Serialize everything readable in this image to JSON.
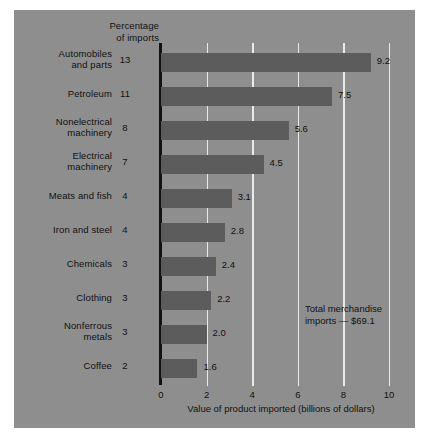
{
  "chart_data": {
    "type": "bar",
    "orientation": "horizontal",
    "title": "",
    "header_label": "Percentage\nof imports",
    "header_label_line1": "Percentage",
    "header_label_line2": "of imports",
    "categories": [
      "Automobiles and parts",
      "Petroleum",
      "Nonelectrical machinery",
      "Electrical machinery",
      "Meats and fish",
      "Iron and steel",
      "Chemicals",
      "Clothing",
      "Nonferrous metals",
      "Coffee"
    ],
    "values": [
      9.2,
      7.5,
      5.6,
      4.5,
      3.1,
      2.8,
      2.4,
      2.2,
      2.0,
      1.6
    ],
    "percentages": [
      13,
      11,
      8,
      7,
      4,
      4,
      3,
      3,
      3,
      2
    ],
    "xlabel": "Value of product imported (billions of dollars)",
    "ylabel": "",
    "xlim": [
      0,
      10
    ],
    "xticks": [
      0,
      2,
      4,
      6,
      8,
      10
    ],
    "xtick_labels": [
      "0",
      "2",
      "4",
      "6",
      "8",
      "10"
    ],
    "grid": "vertical",
    "legend": "none",
    "annotation": "Total merchandise imports = $69.1",
    "annotation_line1": "Total merchandise",
    "annotation_line2": "imports — $69.1",
    "colors": {
      "background": "#8e8e8e",
      "bar": "#5c5c5c",
      "gridline": "#e9e9e9",
      "axis": "#121212",
      "text": "#111111"
    }
  },
  "rows": [
    {
      "label_line1": "Automobiles",
      "label_line2": "and parts",
      "pct": "13",
      "value": "9.2"
    },
    {
      "label_line1": "Petroleum",
      "label_line2": "",
      "pct": "11",
      "value": "7.5"
    },
    {
      "label_line1": "Nonelectrical",
      "label_line2": "machinery",
      "pct": "8",
      "value": "5.6"
    },
    {
      "label_line1": "Electrical",
      "label_line2": "machinery",
      "pct": "7",
      "value": "4.5"
    },
    {
      "label_line1": "Meats and fish",
      "label_line2": "",
      "pct": "4",
      "value": "3.1"
    },
    {
      "label_line1": "Iron and steel",
      "label_line2": "",
      "pct": "4",
      "value": "2.8"
    },
    {
      "label_line1": "Chemicals",
      "label_line2": "",
      "pct": "3",
      "value": "2.4"
    },
    {
      "label_line1": "Clothing",
      "label_line2": "",
      "pct": "3",
      "value": "2.2"
    },
    {
      "label_line1": "Nonferrous",
      "label_line2": "metals",
      "pct": "3",
      "value": "2.0"
    },
    {
      "label_line1": "Coffee",
      "label_line2": "",
      "pct": "2",
      "value": "1.6"
    }
  ]
}
